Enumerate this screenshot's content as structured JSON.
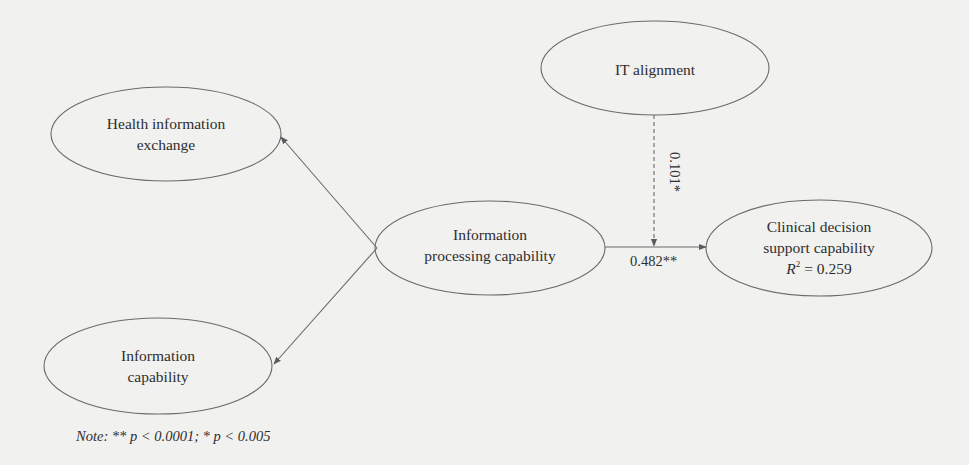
{
  "figure": {
    "type": "structural-model-diagram",
    "background_color": "#f1f1f0",
    "stroke_color": "#6a6a6a",
    "text_color": "#2e2e2e"
  },
  "nodes": {
    "health_information_exchange": {
      "lines": [
        "Health information",
        "exchange"
      ],
      "cx": 166,
      "cy": 134,
      "rx": 115,
      "ry": 47
    },
    "it_alignment": {
      "lines": [
        "IT alignment"
      ],
      "cx": 655,
      "cy": 68,
      "rx": 114,
      "ry": 47
    },
    "information_processing_capability": {
      "lines": [
        "Information",
        "processing capability"
      ],
      "cx": 490,
      "cy": 248,
      "rx": 115,
      "ry": 47
    },
    "clinical_decision_support_capability": {
      "lines": [
        "Clinical decision",
        "support capability"
      ],
      "r2_label": "R",
      "r2_sup": "2",
      "r2_value": " = 0.259",
      "cx": 819,
      "cy": 248,
      "rx": 113,
      "ry": 48
    },
    "information_capability": {
      "lines": [
        "Information",
        "capability"
      ],
      "cx": 158,
      "cy": 366,
      "rx": 114,
      "ry": 48
    }
  },
  "edges": [
    {
      "name": "processing-to-health-exchange",
      "from": "information_processing_capability",
      "to": "health_information_exchange",
      "style": "solid",
      "label": ""
    },
    {
      "name": "processing-to-information-capability",
      "from": "information_processing_capability",
      "to": "information_capability",
      "style": "solid",
      "label": ""
    },
    {
      "name": "processing-to-clinical-decision",
      "from": "information_processing_capability",
      "to": "clinical_decision_support_capability",
      "style": "solid",
      "label": "0.482**"
    },
    {
      "name": "it-alignment-moderation",
      "from": "it_alignment",
      "to": "processing-to-clinical-decision",
      "style": "dashed",
      "label": "0.101*"
    }
  ],
  "labels": {
    "main_path": "0.482**",
    "moderation_path": "0.101*"
  },
  "note": "Note: ** p < 0.0001; * p < 0.005",
  "note_parts": {
    "prefix": "Note: ",
    "two_star": "** ",
    "p1": "p",
    "t1": " < 0.0001; ",
    "one_star": "* ",
    "p2": "p",
    "t2": " < 0.005"
  }
}
